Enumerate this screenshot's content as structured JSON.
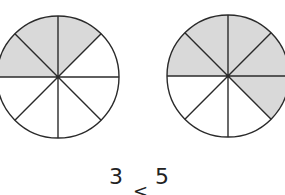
{
  "figure": {
    "type": "fraction-circle-comparison",
    "shade_color": "#d9d9d9",
    "stroke_color": "#2a2a2a",
    "circles": [
      {
        "name": "left-circle",
        "cx": 58,
        "cy": 77,
        "r": 61,
        "sectors": 8,
        "shaded": [
          0,
          1,
          2
        ]
      },
      {
        "name": "right-circle",
        "cx": 228,
        "cy": 76,
        "r": 61,
        "sectors": 8,
        "shaded": [
          0,
          1,
          2,
          3,
          4
        ]
      }
    ]
  },
  "labels": {
    "left_value": "3",
    "right_value": "5",
    "comparison_symbol": "<"
  }
}
